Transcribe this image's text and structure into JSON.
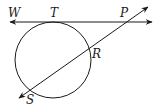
{
  "diagram": {
    "type": "geometry",
    "colors": {
      "stroke": "#1a1a1a",
      "background": "#ffffff"
    },
    "circle": {
      "cx": 53,
      "cy": 60,
      "r": 38
    },
    "tangent_line": {
      "x1": 10,
      "y1": 22,
      "x2": 152,
      "y2": 22
    },
    "secant_line": {
      "x1": 19,
      "y1": 98,
      "x2": 148,
      "y2": 7
    },
    "points": {
      "W": {
        "label": "W",
        "x": 8,
        "y": 17
      },
      "T": {
        "label": "T",
        "x": 50,
        "y": 17
      },
      "P": {
        "label": "P",
        "x": 120,
        "y": 17
      },
      "R": {
        "label": "R",
        "x": 92,
        "y": 58
      },
      "S": {
        "label": "S",
        "x": 26,
        "y": 104
      }
    }
  }
}
